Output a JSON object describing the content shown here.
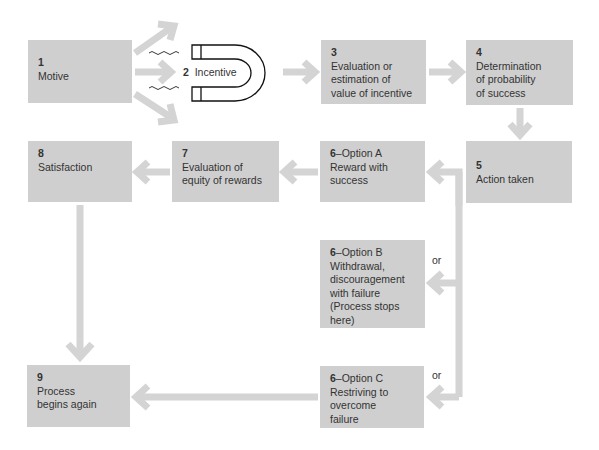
{
  "colors": {
    "box_fill": "#cfcfcf",
    "arrow": "#d4d4d4",
    "text": "#333333"
  },
  "nodes": [
    {
      "id": "1",
      "num": "1",
      "text": "Motive"
    },
    {
      "id": "2",
      "num": "2",
      "text": "Incentive"
    },
    {
      "id": "3",
      "num": "3",
      "text": "Evaluation or\nestimation of\nvalue of incentive"
    },
    {
      "id": "4",
      "num": "4",
      "text": "Determination\nof probability\nof success"
    },
    {
      "id": "5",
      "num": "5",
      "text": "Action taken"
    },
    {
      "id": "6a",
      "num": "6",
      "text": "Reward with\nsuccess",
      "suffix": "–Option A"
    },
    {
      "id": "6b",
      "num": "6",
      "text": "Withdrawal,\ndiscouragement\nwith failure\n(Process stops\nhere)",
      "suffix": "–Option B"
    },
    {
      "id": "6c",
      "num": "6",
      "text": "Restriving to\novercome\nfailure",
      "suffix": "–Option C"
    },
    {
      "id": "7",
      "num": "7",
      "text": "Evaluation of\nequity of rewards"
    },
    {
      "id": "8",
      "num": "8",
      "text": "Satisfaction"
    },
    {
      "id": "9",
      "num": "9",
      "text": "Process\nbegins again"
    }
  ],
  "labels": {
    "or_b": "or",
    "or_c": "or"
  },
  "icons": {
    "magnet": "magnet-icon"
  }
}
